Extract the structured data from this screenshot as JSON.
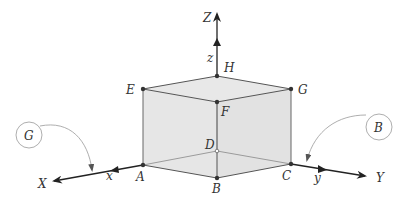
{
  "diagram": {
    "type": "isometric cube with coordinate axes",
    "axes": {
      "X": {
        "label": "X",
        "sub_label": "x"
      },
      "Y": {
        "label": "Y",
        "sub_label": "y"
      },
      "Z": {
        "label": "Z",
        "sub_label": "z"
      }
    },
    "vertices": {
      "A": "A",
      "B": "B",
      "C": "C",
      "D": "D",
      "E": "E",
      "F": "F",
      "G": "G",
      "H": "H"
    },
    "callouts": [
      {
        "label": "G",
        "points_to": "X axis"
      },
      {
        "label": "B",
        "points_to": "Y axis"
      }
    ],
    "colors": {
      "face_fill": "#e4e4e4",
      "edge": "#555555",
      "axis": "#222222",
      "callout": "#888888"
    }
  }
}
